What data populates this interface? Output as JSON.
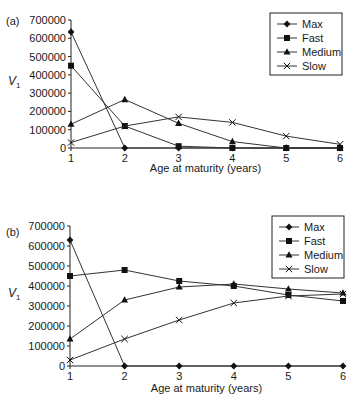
{
  "chart_data": [
    {
      "type": "line",
      "panel_label": "(a)",
      "title": "",
      "xlabel": "Age at maturity (years)",
      "ylabel": "V",
      "ylabel_subscript": "1",
      "x": [
        1,
        2,
        3,
        4,
        5,
        6
      ],
      "x_tick_labels": [
        "1",
        "2",
        "3",
        "4",
        "5",
        "6"
      ],
      "y_tick_labels": [
        "0",
        "100000",
        "200000",
        "300000",
        "400000",
        "500000",
        "600000",
        "700000"
      ],
      "ylim": [
        0,
        700000
      ],
      "grid": false,
      "legend_position": "upper right",
      "series": [
        {
          "name": "Max",
          "marker": "diamond",
          "values": [
            635000,
            0,
            0,
            0,
            0,
            0
          ]
        },
        {
          "name": "Fast",
          "marker": "square",
          "values": [
            450000,
            120000,
            10000,
            0,
            0,
            0
          ]
        },
        {
          "name": "Medium",
          "marker": "triangle",
          "values": [
            130000,
            265000,
            135000,
            35000,
            0,
            0
          ]
        },
        {
          "name": "Slow",
          "marker": "x",
          "values": [
            30000,
            120000,
            170000,
            140000,
            65000,
            20000
          ]
        }
      ]
    },
    {
      "type": "line",
      "panel_label": "(b)",
      "title": "",
      "xlabel": "Age at maturity (years)",
      "ylabel": "V",
      "ylabel_subscript": "1",
      "x": [
        1,
        2,
        3,
        4,
        5,
        6
      ],
      "x_tick_labels": [
        "1",
        "2",
        "3",
        "4",
        "5",
        "6"
      ],
      "y_tick_labels": [
        "0",
        "100000",
        "200000",
        "300000",
        "400000",
        "500000",
        "600000",
        "700000"
      ],
      "ylim": [
        0,
        700000
      ],
      "grid": false,
      "legend_position": "upper right",
      "series": [
        {
          "name": "Max",
          "marker": "diamond",
          "values": [
            630000,
            0,
            0,
            0,
            0,
            0
          ]
        },
        {
          "name": "Fast",
          "marker": "square",
          "values": [
            450000,
            480000,
            425000,
            400000,
            355000,
            325000
          ]
        },
        {
          "name": "Medium",
          "marker": "triangle",
          "values": [
            135000,
            330000,
            395000,
            410000,
            385000,
            365000
          ]
        },
        {
          "name": "Slow",
          "marker": "x",
          "values": [
            30000,
            135000,
            230000,
            315000,
            350000,
            360000
          ]
        }
      ]
    }
  ]
}
